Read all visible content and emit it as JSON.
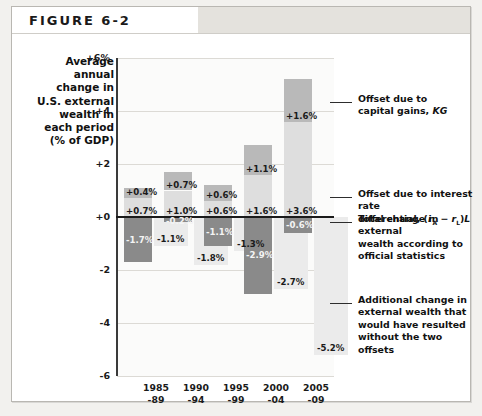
{
  "figure": {
    "label": "FIGURE 6-2"
  },
  "axis_title": "Average\nannual\nchange in\nU.S. external\nwealth in\neach period\n(% of GDP)",
  "callouts": [
    {
      "id": "kg",
      "text": "Offset due to\ncapital gains, KG"
    },
    {
      "id": "ird",
      "text": "Offset due to interest rate\ndifferential, (rA − rL)L"
    },
    {
      "id": "total",
      "text": "Total change in external\nwealth according to\nofficial statistics"
    },
    {
      "id": "addl",
      "text": "Additional change in\nexternal wealth that\nwould have resulted\nwithout the two offsets"
    }
  ],
  "colors": {
    "capital_gains": "#b9b9b9",
    "interest_diff": "#dedede",
    "total_change": "#8a8a8a",
    "additional_change": "#ebebeb",
    "axis": "#3a3a3a",
    "grid": "#dcdad5",
    "zero": "#1a1a1a"
  },
  "chart_data": {
    "type": "bar",
    "xlabel": "",
    "ylabel": "Average annual change in U.S. external wealth in each period (% of GDP)",
    "ylim": [
      -6,
      6
    ],
    "yticks": [
      "+6%",
      "+4",
      "+2",
      "+0",
      "-2",
      "-4",
      "-6"
    ],
    "ytick_values": [
      6,
      4,
      2,
      0,
      -2,
      -4,
      -6
    ],
    "grid": true,
    "legend": "callout-annotations",
    "categories": [
      "1985\n-89",
      "1990\n-94",
      "1995\n-99",
      "2000\n-04",
      "2005\n-09"
    ],
    "category_lines": [
      [
        "1985",
        "-89"
      ],
      [
        "1990",
        "-94"
      ],
      [
        "1995",
        "-99"
      ],
      [
        "2000",
        "-04"
      ],
      [
        "2005",
        "-09"
      ]
    ],
    "series": [
      {
        "name": "Offset due to capital gains, KG",
        "key": "capital_gains",
        "values": [
          0.4,
          0.7,
          0.6,
          1.1,
          1.6
        ],
        "labels": [
          "+0.4%",
          "+0.7%",
          "+0.6%",
          "+1.1%",
          "+1.6%"
        ]
      },
      {
        "name": "Offset due to interest rate differential, (rA - rL)L",
        "key": "interest_diff",
        "values": [
          0.7,
          1.0,
          0.6,
          1.6,
          3.6
        ],
        "labels": [
          "+0.7%",
          "+1.0%",
          "+0.6%",
          "+1.6%",
          "+3.6%"
        ]
      },
      {
        "name": "Total change in external wealth according to official statistics",
        "key": "total_change",
        "values": [
          -1.7,
          -0.2,
          -1.1,
          -2.9,
          -0.6
        ],
        "labels": [
          "-1.7%",
          "-0.2%",
          "-1.1%",
          "-2.9%",
          "-0.6%"
        ]
      },
      {
        "name": "Additional change in external wealth that would have resulted without the two offsets",
        "key": "additional_change",
        "values": [
          -1.1,
          -1.8,
          -1.3,
          -2.7,
          -5.2
        ],
        "labels": [
          "-1.1%",
          "-1.8%",
          "-1.3%",
          "-2.7%",
          "-5.2%"
        ]
      }
    ]
  }
}
